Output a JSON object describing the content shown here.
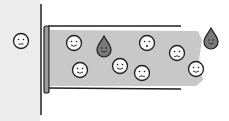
{
  "illustration": {
    "description": "Cartoon of a tube attached to a wall containing smiley-face particles and teardrop particles in gray fluid",
    "colors": {
      "background": "#ffffff",
      "outside_panel": "#ececec",
      "fluid": "#c8c8c8",
      "outline": "#1e1e1e",
      "face_fill": "#fafafa",
      "drop_fill": "#7a7a7a"
    },
    "faces": [
      {
        "x": 21,
        "y": 41,
        "mood": "neutral"
      },
      {
        "x": 74,
        "y": 43,
        "mood": "smile"
      },
      {
        "x": 80,
        "y": 70,
        "mood": "smile"
      },
      {
        "x": 120,
        "y": 66,
        "mood": "smile"
      },
      {
        "x": 147,
        "y": 43,
        "mood": "surprised"
      },
      {
        "x": 142,
        "y": 73,
        "mood": "worried"
      },
      {
        "x": 177,
        "y": 53,
        "mood": "frown"
      },
      {
        "x": 196,
        "y": 69,
        "mood": "smile"
      }
    ],
    "drops": [
      {
        "x": 104,
        "y": 48
      },
      {
        "x": 211,
        "y": 40
      }
    ]
  }
}
